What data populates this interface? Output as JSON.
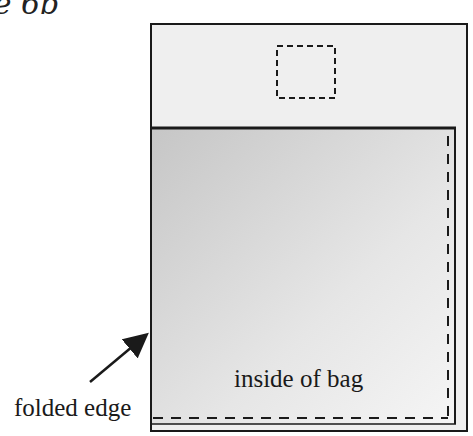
{
  "figure": {
    "visible_title": "ure 6b"
  },
  "labels": {
    "folded_edge": "folded edge",
    "inside_of_bag": "inside of bag"
  },
  "colors": {
    "outer_fill": "#efefef",
    "panel_gradient_start": "#c9c9c9",
    "panel_gradient_end": "#f4f4f4",
    "stroke": "#1a1a1a"
  }
}
